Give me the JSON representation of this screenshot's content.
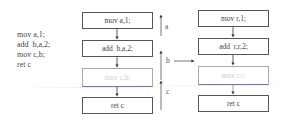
{
  "source_code": {
    "lines": [
      "mov a,1;",
      "add  b,a,2;",
      "mov c,b;",
      "ret c"
    ]
  },
  "left_flow": {
    "blocks": [
      {
        "label": "mov a,1;"
      },
      {
        "label": "add  b,a,2;"
      },
      {
        "label": "mov c,b;",
        "faded": true
      },
      {
        "label": "ret c"
      }
    ]
  },
  "right_flow": {
    "blocks": [
      {
        "label": "mov r,1;"
      },
      {
        "label": "add  r,r,2;"
      },
      {
        "label": "mov r,r;",
        "faded": true
      },
      {
        "label": "ret c"
      }
    ]
  },
  "liveness": {
    "labels": [
      "a",
      "b",
      "c"
    ]
  },
  "colors": {
    "box_border": "#555555",
    "faded_text": "#c8cde0",
    "faded_underline": "#6a72c8",
    "arrow": "#333333"
  }
}
